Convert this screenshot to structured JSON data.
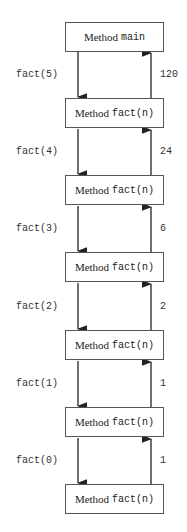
{
  "diagram": {
    "method_word": "Method",
    "boxes": [
      {
        "name": "main"
      },
      {
        "name": "fact(n)"
      },
      {
        "name": "fact(n)"
      },
      {
        "name": "fact(n)"
      },
      {
        "name": "fact(n)"
      },
      {
        "name": "fact(n)"
      },
      {
        "name": "fact(n)"
      }
    ],
    "calls": [
      "fact(5)",
      "fact(4)",
      "fact(3)",
      "fact(2)",
      "fact(1)",
      "fact(0)"
    ],
    "returns": [
      "120",
      "24",
      "6",
      "2",
      "1",
      "1"
    ],
    "colors": {
      "line": "#222222",
      "box_border": "#555555"
    }
  }
}
